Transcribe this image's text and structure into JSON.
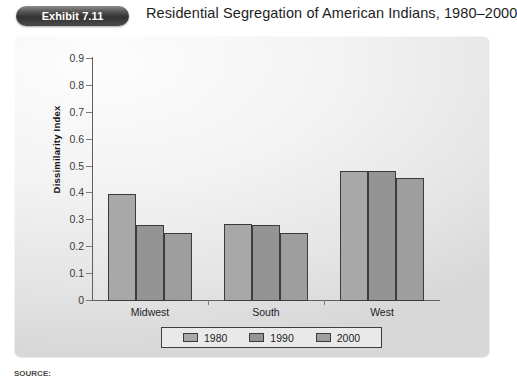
{
  "exhibit": {
    "badge": "Exhibit 7.11",
    "title": "Residential Segregation of American Indians, 1980–2000"
  },
  "source": {
    "label": "SOURCE:",
    "text": ""
  },
  "chart_data": {
    "type": "bar",
    "title": "Residential Segregation of American Indians, 1980–2000",
    "xlabel": "",
    "ylabel": "Dissimilarity Index",
    "categories": [
      "Midwest",
      "South",
      "West"
    ],
    "series": [
      {
        "name": "1980",
        "values": [
          0.395,
          0.283,
          0.48
        ],
        "color": "#a8a8a8"
      },
      {
        "name": "1990",
        "values": [
          0.28,
          0.278,
          0.48
        ],
        "color": "#949494"
      },
      {
        "name": "2000",
        "values": [
          0.25,
          0.248,
          0.455
        ],
        "color": "#9e9e9e"
      }
    ],
    "ylim": [
      0,
      0.9
    ],
    "yticks": [
      0,
      0.1,
      0.2,
      0.3,
      0.4,
      0.5,
      0.6,
      0.7,
      0.8,
      0.9
    ],
    "ytick_labels": [
      "0",
      "0.1",
      "0.2",
      "0.3",
      "0.4",
      "0.5",
      "0.6",
      "0.7",
      "0.8",
      "0.9"
    ],
    "grid": false,
    "legend_position": "bottom"
  }
}
